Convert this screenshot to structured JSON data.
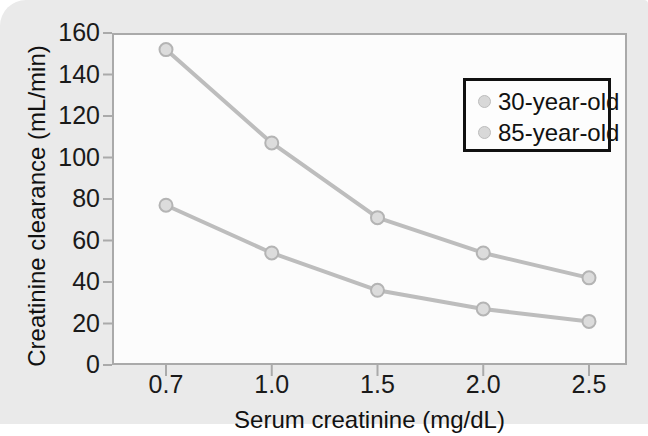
{
  "chart_data": {
    "type": "line",
    "title": "",
    "xlabel": "Serum creatinine (mg/dL)",
    "ylabel": "Creatinine clearance (mL/min)",
    "categories": [
      "0.7",
      "1.0",
      "1.5",
      "2.0",
      "2.5"
    ],
    "x_tick_labels": [
      "0.7",
      "1.0",
      "1.5",
      "2.0",
      "2.5"
    ],
    "y_tick_labels": [
      "0",
      "20",
      "40",
      "60",
      "80",
      "100",
      "120",
      "140",
      "160"
    ],
    "y_ticks": [
      0,
      20,
      40,
      60,
      80,
      100,
      120,
      140,
      160
    ],
    "ylim": [
      0,
      160
    ],
    "grid": false,
    "legend_position": "upper-right",
    "series": [
      {
        "name": "30-year-old",
        "values": [
          152,
          107,
          71,
          54,
          42
        ],
        "color": "#bdbdbd",
        "marker_fill": "#dcdcdc",
        "marker_edge": "#b4b4b4"
      },
      {
        "name": "85-year-old",
        "values": [
          77,
          54,
          36,
          27,
          21
        ],
        "color": "#bdbdbd",
        "marker_fill": "#dcdcdc",
        "marker_edge": "#b4b4b4"
      }
    ]
  },
  "legend": {
    "entries": [
      {
        "label": "30-year-old"
      },
      {
        "label": "85-year-old"
      }
    ]
  },
  "colors": {
    "panel_background": "#eaeaea",
    "plot_background": "#fcfcfc",
    "axis": "#aaaaaa",
    "text": "#111111",
    "line": "#bdbdbd",
    "legend_border": "#111111"
  }
}
